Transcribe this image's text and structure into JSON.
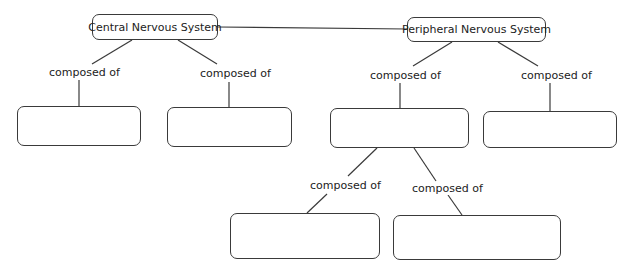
{
  "diagram": {
    "type": "concept-map",
    "nodes": {
      "cns": "Central Nervous System",
      "pns": "Peripheral Nervous System",
      "cns_child_1": "",
      "cns_child_2": "",
      "pns_child_1": "",
      "pns_child_2": "",
      "pns_child_1_sub_1": "",
      "pns_child_1_sub_2": ""
    },
    "links": {
      "cns_1": "composed of",
      "cns_2": "composed of",
      "pns_1": "composed of",
      "pns_2": "composed of",
      "pns_sub_1": "composed of",
      "pns_sub_2": "composed of"
    },
    "colors": {
      "stroke": "#3a3a3a",
      "background": "#ffffff"
    }
  }
}
